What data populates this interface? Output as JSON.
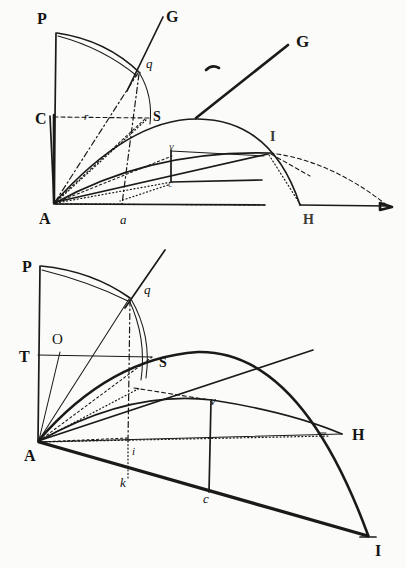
{
  "plate": {
    "title": "Geometric construction plate",
    "background_color": "#fbfbf9",
    "ink_color": "#1a1a18",
    "figure_count": 2
  },
  "figures": [
    {
      "id": "upper-figure",
      "name": "upper-diagram",
      "labels": [
        {
          "key": "P",
          "text": "P",
          "style": "capital",
          "x": 37,
          "y": 24
        },
        {
          "key": "G1",
          "text": "G",
          "style": "capital",
          "x": 166,
          "y": 22
        },
        {
          "key": "q",
          "text": "q",
          "style": "italic",
          "x": 146,
          "y": 68
        },
        {
          "key": "G2",
          "text": "G",
          "style": "capital-bold",
          "x": 296,
          "y": 47
        },
        {
          "key": "C",
          "text": "C",
          "style": "capital",
          "x": 35,
          "y": 124
        },
        {
          "key": "r",
          "text": "r",
          "style": "italic-small",
          "x": 84,
          "y": 120
        },
        {
          "key": "S",
          "text": "S",
          "style": "capital-small",
          "x": 153,
          "y": 121
        },
        {
          "key": "I",
          "text": "I",
          "style": "capital-small",
          "x": 270,
          "y": 141
        },
        {
          "key": "v",
          "text": "v",
          "style": "italic-small",
          "x": 169,
          "y": 150
        },
        {
          "key": "c",
          "text": "c",
          "style": "italic-small",
          "x": 168,
          "y": 187
        },
        {
          "key": "A",
          "text": "A",
          "style": "capital",
          "x": 39,
          "y": 224
        },
        {
          "key": "a",
          "text": "a",
          "style": "italic",
          "x": 120,
          "y": 224
        },
        {
          "key": "H",
          "text": "H",
          "style": "capital-small",
          "x": 303,
          "y": 224
        }
      ],
      "points": {
        "A": [
          54,
          203
        ],
        "P": [
          56,
          33
        ],
        "C": [
          54,
          115
        ],
        "q": [
          138,
          72
        ],
        "S": [
          146,
          118
        ],
        "a": [
          122,
          204
        ],
        "H": [
          308,
          204
        ],
        "I": [
          270,
          152
        ],
        "v": [
          172,
          156
        ],
        "c": [
          172,
          182
        ],
        "G1_tip": [
          163,
          17
        ],
        "G2_tip": [
          288,
          45
        ],
        "axis_end": [
          390,
          207
        ]
      }
    },
    {
      "id": "lower-figure",
      "name": "lower-diagram",
      "labels": [
        {
          "key": "P",
          "text": "P",
          "style": "capital",
          "x": 22,
          "y": 272
        },
        {
          "key": "q",
          "text": "q",
          "style": "italic",
          "x": 144,
          "y": 294
        },
        {
          "key": "O",
          "text": "O",
          "style": "capital-plain",
          "x": 52,
          "y": 344
        },
        {
          "key": "T",
          "text": "T",
          "style": "capital",
          "x": 19,
          "y": 362
        },
        {
          "key": "S",
          "text": "S",
          "style": "capital-small",
          "x": 159,
          "y": 367
        },
        {
          "key": "v",
          "text": "v",
          "style": "italic",
          "x": 210,
          "y": 405
        },
        {
          "key": "H",
          "text": "H",
          "style": "capital",
          "x": 352,
          "y": 440
        },
        {
          "key": "A",
          "text": "A",
          "style": "capital",
          "x": 24,
          "y": 461
        },
        {
          "key": "i",
          "text": "i",
          "style": "italic-small",
          "x": 130,
          "y": 455
        },
        {
          "key": "k",
          "text": "k",
          "style": "italic",
          "x": 120,
          "y": 487
        },
        {
          "key": "c",
          "text": "c",
          "style": "italic",
          "x": 203,
          "y": 503
        },
        {
          "key": "I",
          "text": "I",
          "style": "capital",
          "x": 375,
          "y": 556
        }
      ],
      "points": {
        "A": [
          38,
          441
        ],
        "P": [
          40,
          266
        ],
        "T": [
          38,
          355
        ],
        "O": [
          60,
          352
        ],
        "q": [
          130,
          298
        ],
        "S": [
          152,
          358
        ],
        "H": [
          342,
          434
        ],
        "I": [
          368,
          535
        ],
        "v": [
          212,
          419
        ],
        "k": [
          128,
          478
        ],
        "c": [
          208,
          494
        ],
        "i": [
          128,
          441
        ],
        "ray_tip": [
          313,
          350
        ]
      }
    }
  ],
  "stray_marks": [
    {
      "name": "stray-tick",
      "x": 212,
      "y": 68
    }
  ]
}
